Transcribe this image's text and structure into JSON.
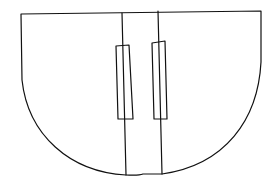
{
  "drawing": {
    "description": "Hand-drawn line sketch of a semicircular cabinet with two center doors and vertical handles",
    "stroke_color": "#111111",
    "background_color": "#ffffff"
  }
}
